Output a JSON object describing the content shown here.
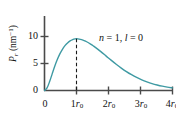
{
  "figure": {
    "clipped_caption": "the Bohr radius",
    "background_color": "#ffffff"
  },
  "chart_data": {
    "type": "line",
    "title": "",
    "subtitle": "",
    "xlabel": "",
    "ylabel": "P_r (nm^-1)",
    "ylabel_symbol": "P",
    "ylabel_subscript": "r",
    "ylabel_units": "(nm",
    "ylabel_units_exp": "−1",
    "ylabel_units_close": ")",
    "grid": false,
    "legend": "none",
    "annotations": [
      {
        "text": "n = 1, l = 0",
        "n_symbol": "n",
        "n_value": " = 1, ",
        "l_symbol": "l",
        "l_value": " = 0",
        "x": 2.05,
        "y": 8.6
      }
    ],
    "xlim": [
      0,
      4
    ],
    "ylim": [
      0,
      11.7
    ],
    "xticks": [
      0,
      1,
      2,
      3,
      4
    ],
    "xtick_labels": [
      "0",
      "1r₀",
      "2r₀",
      "3r₀",
      "4r₀"
    ],
    "xtick_prefixes": [
      "0",
      "1",
      "2",
      "3",
      "4"
    ],
    "xtick_suffix_symbol": "r",
    "xtick_suffix_sub": "0",
    "yticks": [
      0,
      5,
      10
    ],
    "ytick_labels": [
      "0",
      "5",
      "10"
    ],
    "series": [
      {
        "name": "radial probability density n=1, l=0",
        "color": "#3f9aa3",
        "line_width": 1.4,
        "x": [
          0.0,
          0.08,
          0.16,
          0.24,
          0.32,
          0.4,
          0.48,
          0.56,
          0.64,
          0.72,
          0.8,
          0.88,
          0.96,
          1.0,
          1.04,
          1.12,
          1.2,
          1.28,
          1.36,
          1.44,
          1.52,
          1.6,
          1.76,
          1.92,
          2.08,
          2.24,
          2.4,
          2.56,
          2.72,
          2.88,
          3.04,
          3.2,
          3.36,
          3.52,
          3.68,
          3.84,
          4.0
        ],
        "y": [
          0.0,
          0.48,
          1.65,
          3.08,
          4.49,
          5.73,
          6.78,
          7.63,
          8.3,
          8.81,
          9.18,
          9.42,
          9.55,
          9.57,
          9.56,
          9.48,
          9.34,
          9.14,
          8.89,
          8.6,
          8.28,
          7.94,
          7.2,
          6.41,
          5.62,
          4.86,
          4.15,
          3.5,
          2.92,
          2.41,
          1.97,
          1.6,
          1.28,
          1.02,
          0.8,
          0.62,
          0.48
        ]
      }
    ],
    "peak_marker": {
      "type": "dashed-vertical",
      "x": 1,
      "y_top": 9.57,
      "y_bottom": 0,
      "color": "#1a1a1a"
    },
    "axis_color": "#4a4a4a"
  }
}
